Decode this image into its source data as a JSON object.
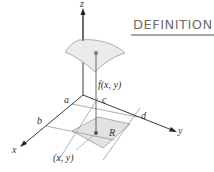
{
  "header": {
    "title": "DEFINITION",
    "underline_color": "#8a8a8a"
  },
  "diagram": {
    "axes": {
      "x_label": "x",
      "y_label": "y",
      "z_label": "z"
    },
    "bounds": {
      "a_label": "a",
      "b_label": "b",
      "c_label": "c",
      "d_label": "d"
    },
    "region_label": "R",
    "function_label": "f(x, y)",
    "point_label": "(x, y)",
    "colors": {
      "axis": "#3a3a3a",
      "gridline": "#9a9a9a",
      "region_fill": "#e2e2e2",
      "surface_fill": "#ebebeb",
      "surface_stroke": "#9c9c9c",
      "point": "#666666"
    }
  }
}
